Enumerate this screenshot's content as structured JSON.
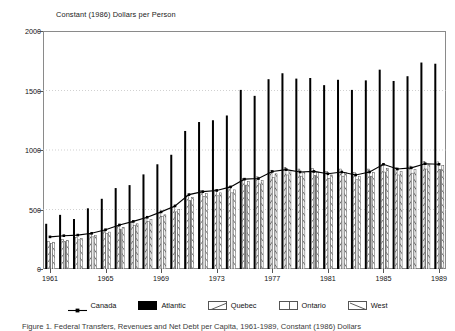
{
  "axis_title": "Constant (1986) Dollars per Person",
  "caption": "Figure 1. Federal Transfers, Revenues and Net Debt per Capita, 1961-1989, Constant (1986) Dollars",
  "legend": [
    {
      "label": "Canada",
      "style": "line-marker",
      "color": "#000000"
    },
    {
      "label": "Atlantic",
      "style": "solid",
      "color": "#000000"
    },
    {
      "label": "Quebec",
      "style": "hatch-forward",
      "color": "#ffffff"
    },
    {
      "label": "Ontario",
      "style": "vertical-split",
      "color": "#ffffff"
    },
    {
      "label": "West",
      "style": "hatch-back",
      "color": "#ffffff"
    }
  ],
  "chart_data": {
    "type": "bar",
    "title": "",
    "xlabel": "",
    "ylabel": "Constant (1986) Dollars per Person",
    "ylim": [
      0,
      2000
    ],
    "yticks": [
      0,
      500,
      1000,
      1500,
      2000
    ],
    "ytick_labels": [
      "0",
      "500",
      "1000",
      "1500",
      "2000"
    ],
    "grid": true,
    "legend_position": "bottom",
    "categories": [
      "1961",
      "1962",
      "1963",
      "1964",
      "1965",
      "1966",
      "1967",
      "1968",
      "1969",
      "1970",
      "1971",
      "1972",
      "1973",
      "1974",
      "1975",
      "1976",
      "1977",
      "1978",
      "1979",
      "1980",
      "1981",
      "1982",
      "1983",
      "1984",
      "1985",
      "1986",
      "1987",
      "1988",
      "1989"
    ],
    "xtick_labels": [
      "1961",
      "1965",
      "1969",
      "1973",
      "1977",
      "1981",
      "1985",
      "1989"
    ],
    "series": [
      {
        "name": "Atlantic",
        "type": "bar",
        "values": [
          380,
          455,
          420,
          510,
          590,
          680,
          705,
          795,
          880,
          960,
          1160,
          1235,
          1250,
          1290,
          1505,
          1455,
          1595,
          1645,
          1600,
          1605,
          1545,
          1590,
          1505,
          1585,
          1675,
          1580,
          1620,
          1735,
          1725
        ]
      },
      {
        "name": "Quebec",
        "type": "bar",
        "values": [
          230,
          250,
          265,
          290,
          320,
          360,
          395,
          430,
          470,
          520,
          620,
          660,
          665,
          690,
          760,
          775,
          830,
          855,
          840,
          845,
          820,
          840,
          810,
          840,
          880,
          850,
          865,
          905,
          900
        ]
      },
      {
        "name": "Ontario",
        "type": "bar",
        "values": [
          215,
          230,
          245,
          270,
          300,
          335,
          365,
          400,
          440,
          480,
          575,
          610,
          615,
          640,
          705,
          715,
          770,
          790,
          780,
          785,
          760,
          780,
          750,
          780,
          815,
          790,
          805,
          840,
          835
        ]
      },
      {
        "name": "West",
        "type": "bar",
        "values": [
          225,
          240,
          255,
          280,
          310,
          350,
          380,
          415,
          455,
          500,
          600,
          635,
          640,
          665,
          735,
          745,
          800,
          825,
          810,
          815,
          790,
          810,
          780,
          810,
          845,
          820,
          835,
          875,
          870
        ]
      },
      {
        "name": "Canada",
        "type": "line",
        "values": [
          270,
          280,
          285,
          300,
          330,
          370,
          400,
          435,
          480,
          530,
          625,
          650,
          660,
          690,
          755,
          760,
          820,
          835,
          815,
          820,
          800,
          815,
          790,
          815,
          880,
          840,
          850,
          885,
          880
        ]
      }
    ]
  }
}
